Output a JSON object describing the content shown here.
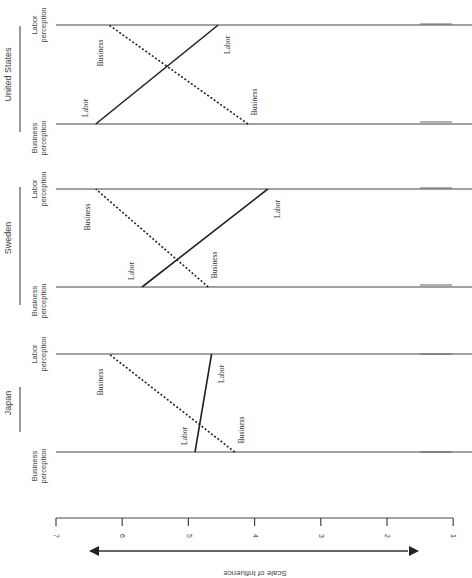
{
  "figure": {
    "orientation": "rotated 90deg clockwise (landscape figure on portrait page)",
    "axis_label": "Scale of Influence",
    "ticks": [
      "7",
      "6",
      "5",
      "4",
      "3",
      "2",
      "1"
    ],
    "panel_row_labels": {
      "top": "Labor\nperception",
      "bottom": "Business\nperception"
    },
    "panel_top_label_lines": [
      "Labor",
      "perception"
    ],
    "panel_bottom_label_lines": [
      "Business",
      "perception"
    ],
    "line_labels": {
      "labor": "Labor",
      "business": "Business"
    },
    "panels": [
      {
        "country": "United States"
      },
      {
        "country": "Sweden"
      },
      {
        "country": "Japan"
      }
    ]
  },
  "chart_data": {
    "type": "line",
    "title": "",
    "xlabel": "Scale of Influence",
    "ylabel": "",
    "xlim": [
      7,
      1
    ],
    "x_ticks": [
      7,
      6,
      5,
      4,
      3,
      2,
      1
    ],
    "grid": false,
    "legend": "inline labels (Labor = solid line, Business = dotted line)",
    "categories": [
      "Business perception",
      "Labor perception"
    ],
    "panels": [
      {
        "country": "United States",
        "series": [
          {
            "name": "Labor",
            "style": "solid",
            "values": [
              6.4,
              4.55
            ]
          },
          {
            "name": "Business",
            "style": "dotted",
            "values": [
              4.1,
              6.2
            ]
          }
        ]
      },
      {
        "country": "Sweden",
        "series": [
          {
            "name": "Labor",
            "style": "solid",
            "values": [
              5.7,
              3.8
            ]
          },
          {
            "name": "Business",
            "style": "dotted",
            "values": [
              4.7,
              6.4
            ]
          }
        ]
      },
      {
        "country": "Japan",
        "series": [
          {
            "name": "Labor",
            "style": "solid",
            "values": [
              4.9,
              4.65
            ]
          },
          {
            "name": "Business",
            "style": "dotted",
            "values": [
              4.3,
              6.2
            ]
          }
        ]
      }
    ]
  }
}
